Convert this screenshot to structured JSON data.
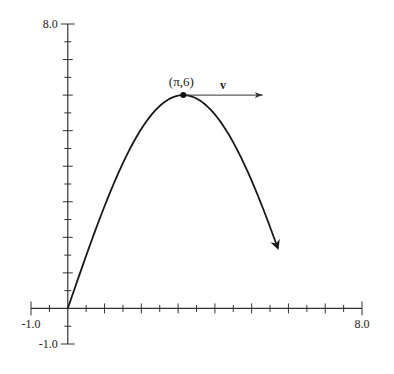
{
  "figure": {
    "x_axis": {
      "min_label": "-1.0",
      "max_label": "8.0",
      "min": -1.0,
      "max": 8.0,
      "tick_step": 0.5
    },
    "y_axis": {
      "min_label": "-1.0",
      "max_label": "8.0",
      "min": -1.0,
      "max": 8.0,
      "tick_step": 0.5
    },
    "point": {
      "label": "(π,6)",
      "x": 3.14159,
      "y": 6
    },
    "vector": {
      "label": "v",
      "from_x": 3.14159,
      "from_y": 6,
      "to_x": 5.3,
      "to_y": 6
    },
    "curve": {
      "t_start": 0,
      "t_end": 5.71,
      "description": "rises from origin to peak (π,6) then descends, ends with arrowhead"
    },
    "colors": {
      "axis": "#333333",
      "curve": "#1a1a1a",
      "text": "#222222"
    }
  }
}
